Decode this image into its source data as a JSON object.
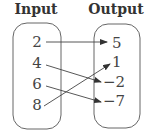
{
  "diagram": {
    "type": "mapping",
    "input_header": "Input",
    "output_header": "Output",
    "inputs": [
      "2",
      "4",
      "6",
      "8"
    ],
    "outputs": [
      "5",
      "1",
      "−2",
      "−7"
    ],
    "mappings": [
      {
        "from": "2",
        "to": "5"
      },
      {
        "from": "4",
        "to": "−2"
      },
      {
        "from": "6",
        "to": "−7"
      },
      {
        "from": "8",
        "to": "1"
      }
    ],
    "colors": {
      "stroke": "#555555",
      "text": "#444444"
    }
  }
}
